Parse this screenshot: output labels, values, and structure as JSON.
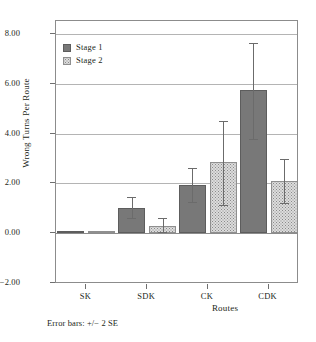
{
  "chart_data": {
    "type": "bar",
    "title": "",
    "xlabel": "Routes",
    "ylabel": "Wrong Turns Per Route",
    "categories": [
      "SK",
      "SDK",
      "CK",
      "CDK"
    ],
    "ylim": [
      -2.0,
      8.0
    ],
    "ytick_labels": [
      "8.00",
      "6.00",
      "4.00",
      "2.00",
      "0.00",
      "-2.00"
    ],
    "ytick_values": [
      8.0,
      6.0,
      4.0,
      2.0,
      0.0,
      -2.0
    ],
    "grid": "horizontal",
    "legend_position": "top-left",
    "series": [
      {
        "name": "Stage 1",
        "color": "#787878",
        "pattern": "solid",
        "values": [
          0.02,
          1.03,
          1.95,
          5.75
        ],
        "error_low": [
          0.0,
          0.6,
          1.25,
          3.8
        ],
        "error_high": [
          0.05,
          1.45,
          2.6,
          7.65
        ]
      },
      {
        "name": "Stage 2",
        "color": "#dcdcdc",
        "pattern": "dotted",
        "values": [
          0.02,
          0.3,
          2.85,
          2.1
        ],
        "error_low": [
          0.0,
          0.05,
          1.15,
          1.2
        ],
        "error_high": [
          0.05,
          0.6,
          4.5,
          3.0
        ]
      }
    ],
    "annotations": [
      "Error bars: +/− 2 SE"
    ]
  },
  "legend": {
    "items": [
      {
        "label": "Stage 1",
        "swatch": "stage1-swatch"
      },
      {
        "label": "Stage 2",
        "swatch": "stage2-swatch"
      }
    ]
  },
  "axes": {
    "y_title": "Wrong Turns Per Route",
    "x_title": "Routes",
    "y_ticks": [
      "8.00",
      "6.00",
      "4.00",
      "2.00",
      "0.00",
      "-2.00"
    ],
    "x_ticks": [
      "SK",
      "SDK",
      "CK",
      "CDK"
    ]
  },
  "footnote": {
    "text": "Error bars: +/− 2 SE"
  },
  "colors": {
    "stage1": "#787878",
    "stage2": "#dcdcdc",
    "grid": "#b4b4b4",
    "frame": "#8c8c8c",
    "text": "#231f20"
  }
}
